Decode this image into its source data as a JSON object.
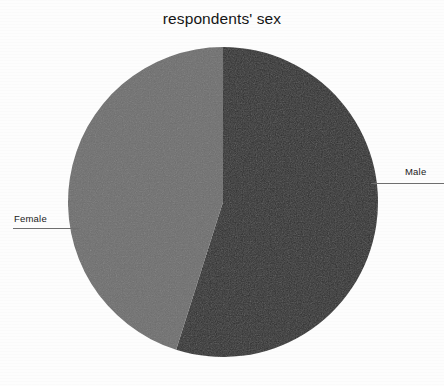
{
  "chart_data": {
    "type": "pie",
    "title": "respondents' sex",
    "xlabel": "",
    "ylabel": "",
    "categories": [
      "Male",
      "Female"
    ],
    "values": [
      54.9,
      45.1
    ],
    "units": "percent",
    "start_angle_deg": 0,
    "direction": "clockwise",
    "legend_position": "none",
    "labels_position": "outside-with-leader-lines",
    "grid": false,
    "slices": [
      {
        "name": "Male",
        "value": 54.9,
        "color": "#2e2e2e",
        "start_angle_deg": 0,
        "end_angle_deg": 197.6,
        "label": "Male",
        "label_side": "right"
      },
      {
        "name": "Female",
        "value": 45.1,
        "color": "#6e6e6e",
        "start_angle_deg": 197.6,
        "end_angle_deg": 360,
        "label": "Female",
        "label_side": "left"
      }
    ]
  },
  "chart": {
    "title": "respondents' sex",
    "geometry": {
      "center_x": 223,
      "center_y": 202,
      "radius": 155
    },
    "labels": {
      "male": "Male",
      "female": "Female"
    },
    "colors": {
      "male_slice": "#2e2e2e",
      "female_slice": "#6e6e6e",
      "background": "#fdfdfd",
      "title_text": "#151515",
      "label_text": "#1a1a1a",
      "leader_line": "#6f6f6f"
    }
  }
}
